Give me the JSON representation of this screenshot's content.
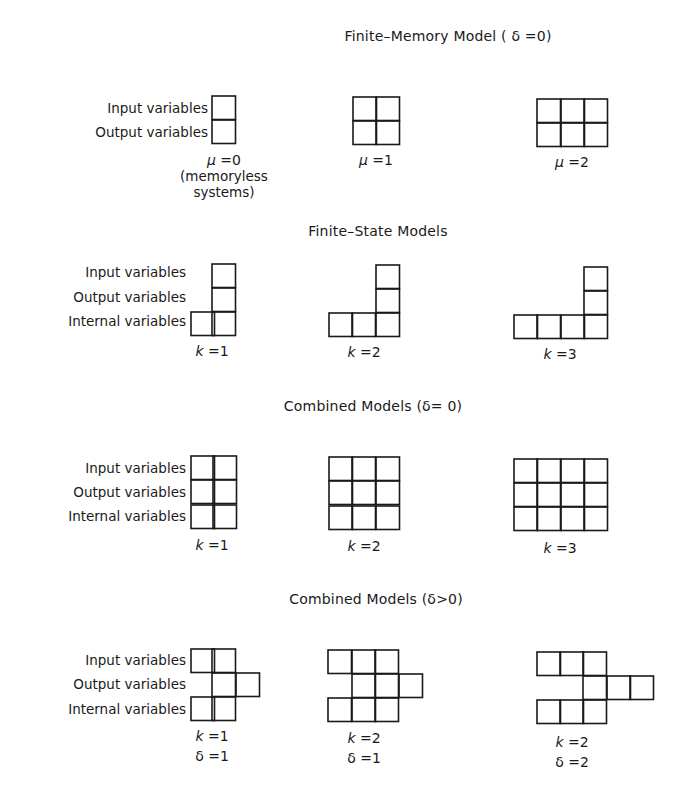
{
  "sections": [
    {
      "id": "finite-memory",
      "title": "Finite–Memory Model ( δ =0)",
      "title_pos": [
        448,
        38
      ],
      "row_labels": [
        {
          "text": "Input variables",
          "x": 208,
          "y": 100
        },
        {
          "text": "Output variables",
          "x": 208,
          "y": 124
        }
      ],
      "diagrams": [
        {
          "caption_var": "μ",
          "caption_val": "0",
          "caption_pos": [
            224,
            152
          ],
          "note": "(memoryless\nsystems)",
          "note_pos": [
            224,
            176
          ],
          "cells": [
            [
              212,
              96
            ],
            [
              212,
              120
            ]
          ]
        },
        {
          "caption_var": "μ",
          "caption_val": "1",
          "caption_pos": [
            376,
            152
          ],
          "cells": [
            [
              353,
              97
            ],
            [
              376,
              97
            ],
            [
              353,
              121
            ],
            [
              376,
              121
            ]
          ]
        },
        {
          "caption_var": "μ",
          "caption_val": "2",
          "caption_pos": [
            572,
            154
          ],
          "cells": [
            [
              537,
              99
            ],
            [
              561,
              99
            ],
            [
              584,
              99
            ],
            [
              537,
              123
            ],
            [
              561,
              123
            ],
            [
              584,
              123
            ]
          ]
        }
      ]
    },
    {
      "id": "finite-state",
      "title": "Finite–State Models",
      "title_pos": [
        378,
        233
      ],
      "row_labels": [
        {
          "text": "Input variables",
          "x": 186,
          "y": 264
        },
        {
          "text": "Output variables",
          "x": 186,
          "y": 289
        },
        {
          "text": "Internal variables",
          "x": 186,
          "y": 313
        }
      ],
      "diagrams": [
        {
          "caption_var": "k",
          "caption_val": "1",
          "caption_pos": [
            212,
            343
          ],
          "cells": [
            [
              212,
              264
            ],
            [
              212,
              288
            ],
            [
              191,
              312
            ],
            [
              212,
              312
            ]
          ]
        },
        {
          "caption_var": "k",
          "caption_val": "2",
          "caption_pos": [
            364,
            344
          ],
          "cells": [
            [
              376,
              265
            ],
            [
              376,
              289
            ],
            [
              329,
              313
            ],
            [
              352,
              313
            ],
            [
              376,
              313
            ]
          ]
        },
        {
          "caption_var": "k",
          "caption_val": "3",
          "caption_pos": [
            560,
            346
          ],
          "cells": [
            [
              584,
              267
            ],
            [
              584,
              291
            ],
            [
              514,
              315
            ],
            [
              537,
              315
            ],
            [
              561,
              315
            ],
            [
              584,
              315
            ]
          ]
        }
      ]
    },
    {
      "id": "combined-zero",
      "title": "Combined Models (δ= 0)",
      "title_pos": [
        373,
        408
      ],
      "row_labels": [
        {
          "text": "Input variables",
          "x": 186,
          "y": 460
        },
        {
          "text": "Output variables",
          "x": 186,
          "y": 484
        },
        {
          "text": "Internal variables",
          "x": 186,
          "y": 508
        }
      ],
      "diagrams": [
        {
          "caption_var": "k",
          "caption_val": "1",
          "caption_pos": [
            212,
            537
          ],
          "cells": [
            [
              191,
              456
            ],
            [
              213,
              456
            ],
            [
              191,
              480
            ],
            [
              213,
              480
            ],
            [
              191,
              505
            ],
            [
              213,
              505
            ]
          ]
        },
        {
          "caption_var": "k",
          "caption_val": "2",
          "caption_pos": [
            364,
            538
          ],
          "cells": [
            [
              329,
              457
            ],
            [
              352,
              457
            ],
            [
              376,
              457
            ],
            [
              329,
              481
            ],
            [
              352,
              481
            ],
            [
              376,
              481
            ],
            [
              329,
              506
            ],
            [
              352,
              506
            ],
            [
              376,
              506
            ]
          ]
        },
        {
          "caption_var": "k",
          "caption_val": "3",
          "caption_pos": [
            560,
            540
          ],
          "cells": [
            [
              514,
              459
            ],
            [
              537,
              459
            ],
            [
              561,
              459
            ],
            [
              584,
              459
            ],
            [
              514,
              483
            ],
            [
              537,
              483
            ],
            [
              561,
              483
            ],
            [
              584,
              483
            ],
            [
              514,
              507
            ],
            [
              537,
              507
            ],
            [
              561,
              507
            ],
            [
              584,
              507
            ]
          ]
        }
      ]
    },
    {
      "id": "combined-positive",
      "title": "Combined Models (δ>0)",
      "title_pos": [
        376,
        601
      ],
      "row_labels": [
        {
          "text": "Input variables",
          "x": 186,
          "y": 652
        },
        {
          "text": "Output variables",
          "x": 186,
          "y": 676
        },
        {
          "text": "Internal variables",
          "x": 186,
          "y": 701
        }
      ],
      "diagrams": [
        {
          "caption_var": "k",
          "caption_val": "1",
          "caption2_var": "δ",
          "caption2_val": "1",
          "caption_pos": [
            212,
            728
          ],
          "cells": [
            [
              191,
              649
            ],
            [
              212,
              649
            ],
            [
              212,
              673
            ],
            [
              236,
              673
            ],
            [
              191,
              697
            ],
            [
              212,
              697
            ]
          ]
        },
        {
          "caption_var": "k",
          "caption_val": "2",
          "caption2_var": "δ",
          "caption2_val": "1",
          "caption_pos": [
            364,
            730
          ],
          "cells": [
            [
              328,
              650
            ],
            [
              352,
              650
            ],
            [
              375,
              650
            ],
            [
              352,
              674
            ],
            [
              375,
              674
            ],
            [
              399,
              674
            ],
            [
              328,
              698
            ],
            [
              352,
              698
            ],
            [
              375,
              698
            ]
          ]
        },
        {
          "caption_var": "k",
          "caption_val": "2",
          "caption2_var": "δ",
          "caption2_val": "2",
          "caption_pos": [
            572,
            734
          ],
          "cells": [
            [
              537,
              652
            ],
            [
              560,
              652
            ],
            [
              583,
              652
            ],
            [
              583,
              676
            ],
            [
              607,
              676
            ],
            [
              630,
              676
            ],
            [
              537,
              700
            ],
            [
              560,
              700
            ],
            [
              583,
              700
            ]
          ]
        }
      ]
    }
  ],
  "cell_size": 23.5,
  "stroke_color": "#1a1a1a"
}
